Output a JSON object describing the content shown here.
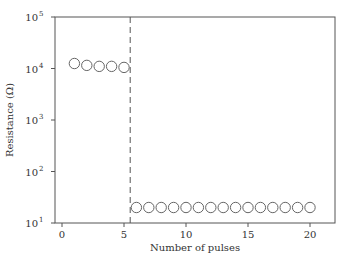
{
  "chart_data": {
    "type": "scatter",
    "title": "",
    "xlabel": "Number of pulses",
    "ylabel": "Resistance (Ω)",
    "xlim": [
      -1,
      22
    ],
    "ylim": [
      10,
      100000
    ],
    "yscale": "log",
    "grid": false,
    "legend": null,
    "x_ticks": [
      0,
      5,
      10,
      15,
      20
    ],
    "y_ticks": [
      "10^1",
      "10^2",
      "10^3",
      "10^4",
      "10^5"
    ],
    "marker": "open-circle",
    "annotations": [
      {
        "type": "vertical-dashed-line",
        "x": 5.5
      }
    ],
    "series": [
      {
        "name": "Resistance",
        "x": [
          1,
          2,
          3,
          4,
          5,
          6,
          7,
          8,
          9,
          10,
          11,
          12,
          13,
          14,
          15,
          16,
          17,
          18,
          19,
          20
        ],
        "y": [
          12500,
          11500,
          11000,
          11000,
          10500,
          20,
          20,
          20,
          20,
          20,
          20,
          20,
          20,
          20,
          20,
          20,
          20,
          20,
          20,
          20
        ]
      }
    ]
  },
  "labels": {
    "xlabel": "Number of pulses",
    "ylabel": "Resistance (Ω)",
    "x_ticks": [
      "0",
      "5",
      "10",
      "15",
      "20"
    ],
    "y_tick_base": "10",
    "y_tick_exps": [
      "1",
      "2",
      "3",
      "4",
      "5"
    ]
  },
  "colors": {
    "axis": "#555555",
    "marker": "#666666",
    "dashed_line": "#555555"
  }
}
